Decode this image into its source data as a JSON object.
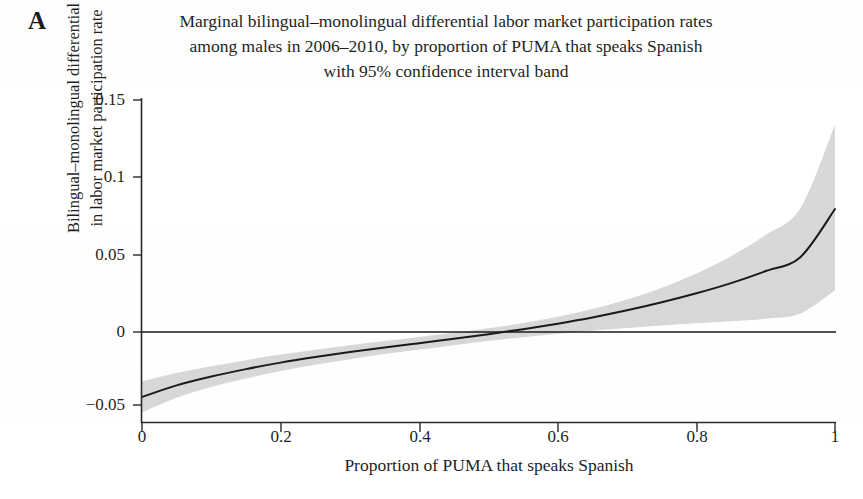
{
  "panel": {
    "letter": "A"
  },
  "title": {
    "line1": "Marginal bilingual–monolingual differential labor market participation rates",
    "line2": "among males in 2006–2010, by proportion of PUMA that speaks Spanish",
    "line3": "with 95% confidence interval band"
  },
  "axes": {
    "ylabel_line1": "Bilingual–monolingual differential",
    "ylabel_line2": "in labor market participation rate",
    "xlabel": "Proportion of PUMA that speaks Spanish"
  },
  "colors": {
    "line": "#1a1a1a",
    "band": "#d8d8d8",
    "axis": "#2a2a2a",
    "background": "#ffffff",
    "text": "#1f1f1f"
  },
  "chart_data": {
    "type": "line",
    "title": "Marginal bilingual–monolingual differential labor market participation rates among males in 2006–2010, by proportion of PUMA that speaks Spanish with 95% confidence interval band",
    "xlabel": "Proportion of PUMA that speaks Spanish",
    "ylabel": "Bilingual–monolingual differential in labor market participation rate",
    "xlim": [
      0,
      1
    ],
    "ylim": [
      -0.065,
      0.155
    ],
    "grid": false,
    "legend": "none",
    "xticks": [
      0,
      0.2,
      0.4,
      0.6,
      0.8,
      1
    ],
    "xtick_labels": [
      "0",
      "0.2",
      "0.4",
      "0.6",
      "0.8",
      "1"
    ],
    "yticks": [
      -0.05,
      0,
      0.05,
      0.1,
      0.15
    ],
    "ytick_labels": [
      "−0.05",
      "0",
      "0.05",
      "0.1",
      "0.15"
    ],
    "reference_line": {
      "y": 0,
      "style": "solid",
      "color": "#1a1a1a"
    },
    "x": [
      0,
      0.05,
      0.1,
      0.15,
      0.2,
      0.25,
      0.3,
      0.35,
      0.4,
      0.45,
      0.5,
      0.55,
      0.6,
      0.65,
      0.7,
      0.75,
      0.8,
      0.85,
      0.9,
      0.95,
      1
    ],
    "series": [
      {
        "name": "Marginal differential (fitted)",
        "values": [
          -0.042,
          -0.0345,
          -0.0288,
          -0.024,
          -0.0198,
          -0.0162,
          -0.013,
          -0.01,
          -0.0072,
          -0.0044,
          -0.0014,
          0.0018,
          0.0054,
          0.0094,
          0.014,
          0.0192,
          0.025,
          0.0316,
          0.0394,
          0.0484,
          0.0795
        ]
      }
    ],
    "confidence_band": {
      "level": "95%",
      "color": "#d8d8d8",
      "lower": [
        -0.052,
        -0.0425,
        -0.0355,
        -0.03,
        -0.0252,
        -0.0212,
        -0.0176,
        -0.0143,
        -0.0113,
        -0.0085,
        -0.0058,
        -0.0034,
        -0.0012,
        0.0008,
        0.0026,
        0.0042,
        0.0056,
        0.007,
        0.0086,
        0.012,
        0.027
      ],
      "upper": [
        -0.0318,
        -0.0265,
        -0.0222,
        -0.0182,
        -0.0146,
        -0.0114,
        -0.0085,
        -0.0058,
        -0.0032,
        -0.0005,
        0.0024,
        0.0058,
        0.0098,
        0.0148,
        0.021,
        0.0286,
        0.0378,
        0.049,
        0.0628,
        0.08,
        0.134
      ]
    }
  }
}
